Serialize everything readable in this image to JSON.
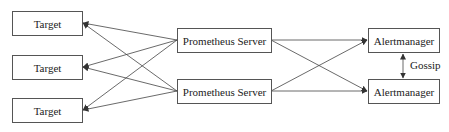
{
  "diagram": {
    "targets": [
      {
        "label": "Target"
      },
      {
        "label": "Target"
      },
      {
        "label": "Target"
      }
    ],
    "servers": [
      {
        "label": "Prometheus Server"
      },
      {
        "label": "Prometheus Server"
      }
    ],
    "alertmanagers": [
      {
        "label": "Alertmanager"
      },
      {
        "label": "Alertmanager"
      }
    ],
    "gossip_label": "Gossip",
    "colors": {
      "line": "#444444",
      "border": "#555555",
      "text": "#222222",
      "background": "#ffffff"
    }
  }
}
